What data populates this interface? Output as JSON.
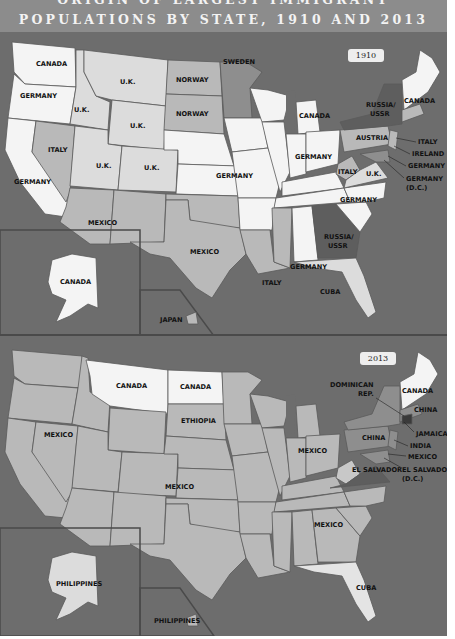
{
  "title": {
    "line1": "ORIGIN OF LARGEST IMMIGRANT",
    "line2": "POPULATIONS BY STATE, 1910 AND 2013"
  },
  "colors": {
    "ocean": "#6d6d6d",
    "title_bg": "#8c8c8c",
    "white_state": "#f4f4f4",
    "light_state": "#dcdcdc",
    "mid_state": "#b9b9b9",
    "dark_state": "#8e8e8e",
    "darkest_state": "#5e5e5e"
  },
  "maps": [
    {
      "year": "1910",
      "labels": {
        "wa": "CANADA",
        "or": "GERMANY",
        "ca": "GERMANY",
        "id": "U.K.",
        "mt": "U.K.",
        "nv": "ITALY",
        "ut": "U.K.",
        "wy": "U.K.",
        "co": "U.K.",
        "az_nm": "MEXICO",
        "nd": "NORWAY",
        "sd": "NORWAY",
        "mn": "SWEDEN",
        "plains": "GERMANY",
        "tx": "MEXICO",
        "la": "ITALY",
        "mi": "CANADA",
        "oh_in": "GERMANY",
        "il": "GERMANY",
        "wv": "ITALY",
        "va": "U.K.",
        "nc_tn": "GERMANY",
        "al": "GERMANY",
        "ga": "RUSSIA/ USSR",
        "ny": "RUSSIA/ USSR",
        "pa": "AUSTRIA",
        "ne_states": "CANADA",
        "nj": "ITALY",
        "de": "IRELAND",
        "md": "GERMANY",
        "dc": "GERMANY (D.C.)",
        "fl": "CUBA",
        "ak": "CANADA",
        "hi": "JAPAN"
      }
    },
    {
      "year": "2013",
      "labels": {
        "mt": "CANADA",
        "nd": "CANADA",
        "sd": "ETHIOPIA",
        "west": "MEXICO",
        "central": "MEXICO",
        "midwest": "MEXICO",
        "south": "MEXICO",
        "ny": "DOMINICAN REP.",
        "ne_states": "CANADA",
        "ma": "CHINA",
        "pa": "CHINA",
        "nj": "JAMAICA",
        "de": "INDIA",
        "md": "MEXICO",
        "va": "EL SALVADOR",
        "dc": "EL SALVADOR (D.C.)",
        "fl": "CUBA",
        "ak": "PHILIPPINES",
        "hi": "PHILIPPINES"
      }
    }
  ]
}
